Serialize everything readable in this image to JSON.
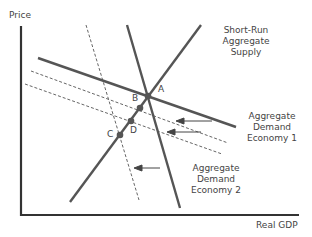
{
  "axes": {
    "y_label": "Price",
    "x_label": "Real GDP"
  },
  "curves": {
    "sras": {
      "label_lines": [
        "Short-Run",
        "Aggregate",
        "Supply"
      ]
    },
    "ad1": {
      "label_lines": [
        "Aggregate",
        "Demand",
        "Economy 1"
      ]
    },
    "ad2": {
      "label_lines": [
        "Aggregate",
        "Demand",
        "Economy 2"
      ]
    }
  },
  "points": {
    "a": "A",
    "b": "B",
    "c": "C",
    "d": "D"
  },
  "colors": {
    "line": "#555555",
    "axis": "#333333",
    "text": "#444444"
  }
}
